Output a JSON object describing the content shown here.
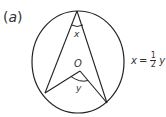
{
  "part_label": {
    "open": "(",
    "letter": "a",
    "close": ")"
  },
  "diagram": {
    "circle": {
      "cx": 78,
      "cy": 62,
      "rx": 46,
      "ry": 51
    },
    "points": {
      "top": [
        77,
        11
      ],
      "left": [
        45,
        93
      ],
      "right": [
        107,
        103
      ],
      "center_O": [
        80,
        71
      ]
    },
    "labels": {
      "center": "O",
      "inscribed_angle": "x",
      "central_angle": "y"
    }
  },
  "equation": {
    "lhs": "x",
    "equals": "=",
    "numerator": "1",
    "denominator": "2",
    "rhs": "y"
  },
  "colors": {
    "stroke": "#222222",
    "text": "#333333"
  }
}
